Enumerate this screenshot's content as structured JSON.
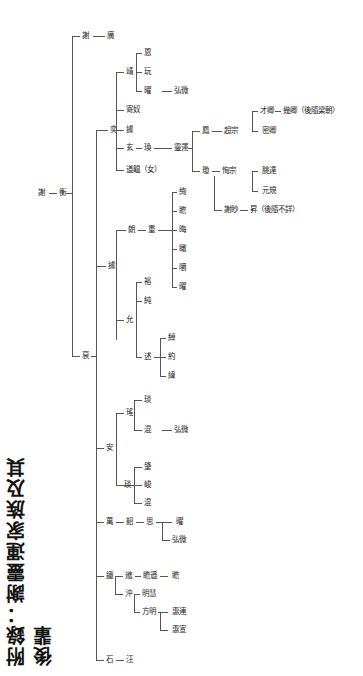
{
  "title": "附錄：謝靈運家族及其後輩",
  "nodes": {
    "root_a": "謝",
    "root_b": "衡",
    "g1_top_a": "謝",
    "g1_top_b": "廣",
    "g1_main": "裒",
    "yi": "奕",
    "yi_c1": "靖",
    "yi_c1_s1": "恩",
    "yi_c1_s2": "玩",
    "yi_c1_s3": "曜",
    "yi_c1_s3_c": "弘微",
    "yi_c2": "寄奴",
    "yi_c3": "據",
    "yi_c4": "玄",
    "yi_c4_s": "瑍",
    "yi_c4_s_c": "靈運",
    "lingyun_c1": "鳳",
    "lingyun_c1_c": "超宗",
    "lingyun_c1_c_c1": "才卿",
    "lingyun_c1_c_c1b": "幾卿（後隨梁朝）",
    "lingyun_c1_c_c2": "密卿",
    "lingyun_c2": "瓊",
    "lingyun_c2_c": "恂宗",
    "lingyun_c2_c_c1": "朓達",
    "lingyun_c2_c_c2": "元規",
    "lingyun_c3": "謝眇",
    "lingyun_c3_c": "昇（後隨不詳）",
    "yi_c5": "道韞（女）",
    "an_branch": "據",
    "an_c1": "朗",
    "an_c1_s": "重",
    "an_c1_s_c": [
      "絢",
      "瞻",
      "晦",
      "瞰",
      "嚼",
      "曜"
    ],
    "an_c2": "允",
    "an_c2_s1": "裕",
    "an_c2_s2": "純",
    "an_c2_s3": "述",
    "an_c2_s3_c": [
      "綽",
      "約",
      "緯"
    ],
    "an": "安",
    "an_s1": "瑤",
    "an_s1_c1": "琰",
    "an_s1_c2": "混",
    "an_s1_c2_c": "弘微",
    "an_s2": "琰",
    "an_s2_c": [
      "肇",
      "峻",
      "混"
    ],
    "wan": "萬",
    "wan_c": "韶",
    "wan_c_c": "思",
    "wan_c_c_c1": "曜",
    "wan_c_c_c2": "弘微",
    "tie": "鐵",
    "tie_c1": "邈",
    "tie_c1_c": "瞻遜",
    "tie_c1_c_c": "瞻",
    "tie_c2": "沖",
    "tie_c2_c1": "明慧",
    "tie_c2_c2": "方明",
    "tie_c2_c2_c1": "惠連",
    "tie_c2_c2_c2": "惠宣",
    "shi": "石",
    "shi_c": "汪"
  }
}
